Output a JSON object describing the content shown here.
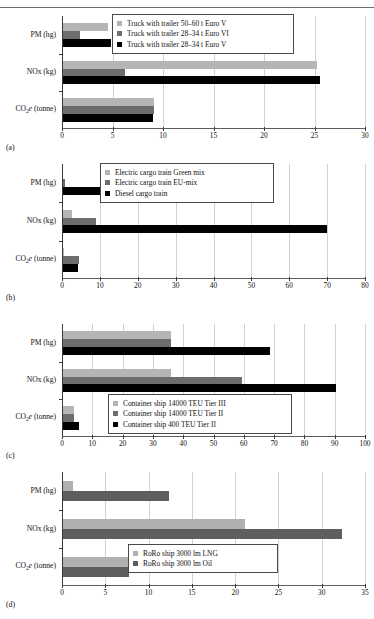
{
  "figure": {
    "ghost_header": "",
    "categories": [
      "PM (hg)",
      "NOx (kg)",
      "CO2e (tonne)"
    ],
    "colors": {
      "light": "#b5b5b5",
      "medium": "#6d6d6d",
      "dark": "#000000",
      "roro_light": "#b0b0b0",
      "roro_dark": "#5e5e5e",
      "grid": "#d2d2d2",
      "axis": "#3a3a3a"
    }
  },
  "panels": [
    {
      "tag": "(a)",
      "chart_data": {
        "type": "bar",
        "orientation": "horizontal",
        "title": "",
        "xlabel": "",
        "ylabel": "",
        "xlim": [
          0,
          30
        ],
        "xticks": [
          0,
          5,
          10,
          15,
          20,
          25,
          30
        ],
        "grid": true,
        "legend_position": "top-right-inside",
        "categories": [
          "PM (hg)",
          "NOx (kg)",
          "CO2e (tonne)"
        ],
        "series": [
          {
            "name": "Truck with trailer 50–60 t Euro V",
            "color": "#b5b5b5",
            "values": [
              4.6,
              25.2,
              9.1
            ]
          },
          {
            "name": "Truck with trailer 28–34 t Euro VI",
            "color": "#6d6d6d",
            "values": [
              1.8,
              6.2,
              9.1
            ]
          },
          {
            "name": "Truck with trailer 28–34 t Euro V",
            "color": "#000000",
            "values": [
              4.9,
              25.5,
              9.0
            ]
          }
        ]
      }
    },
    {
      "tag": "(b)",
      "chart_data": {
        "type": "bar",
        "orientation": "horizontal",
        "title": "",
        "xlabel": "",
        "ylabel": "",
        "xlim": [
          0,
          80
        ],
        "xticks": [
          0,
          10,
          20,
          30,
          40,
          50,
          60,
          70,
          80
        ],
        "grid": true,
        "legend_position": "top-center-inside",
        "categories": [
          "PM (hg)",
          "NOx (kg)",
          "CO2e (tonne)"
        ],
        "series": [
          {
            "name": "Electric cargo train Green mix",
            "color": "#b5b5b5",
            "values": [
              0.2,
              2.6,
              0.5
            ]
          },
          {
            "name": "Electric cargo train EU-mix",
            "color": "#6d6d6d",
            "values": [
              0.8,
              9.0,
              4.6
            ]
          },
          {
            "name": "Diesel cargo train",
            "color": "#000000",
            "values": [
              13.2,
              70.0,
              4.1
            ]
          }
        ]
      }
    },
    {
      "tag": "(c)",
      "chart_data": {
        "type": "bar",
        "orientation": "horizontal",
        "title": "",
        "xlabel": "",
        "ylabel": "",
        "xlim": [
          0,
          100
        ],
        "xticks": [
          0,
          10,
          20,
          30,
          40,
          50,
          60,
          70,
          80,
          90,
          100
        ],
        "grid": true,
        "legend_position": "bottom-center-inside",
        "categories": [
          "PM (hg)",
          "NOx (kg)",
          "CO2e (tonne)"
        ],
        "series": [
          {
            "name": "Container ship 14000 TEU Tier III",
            "color": "#b5b5b5",
            "values": [
              36.0,
              36.0,
              4.0
            ]
          },
          {
            "name": "Container ship 14000 TEU Tier II",
            "color": "#6d6d6d",
            "values": [
              36.0,
              59.5,
              4.0
            ]
          },
          {
            "name": "Container ship 400 TEU Tier II",
            "color": "#000000",
            "values": [
              68.5,
              90.5,
              5.5
            ]
          }
        ]
      }
    },
    {
      "tag": "(d)",
      "chart_data": {
        "type": "bar",
        "orientation": "horizontal",
        "title": "",
        "xlabel": "",
        "ylabel": "",
        "xlim": [
          0,
          35
        ],
        "xticks": [
          0,
          5,
          10,
          15,
          20,
          25,
          30,
          35
        ],
        "grid": true,
        "legend_position": "bottom-center-inside",
        "categories": [
          "PM (hg)",
          "NOx (kg)",
          "CO2e (tonne)"
        ],
        "series": [
          {
            "name": "RoRo ship 3000 lm LNG",
            "color": "#b0b0b0",
            "values": [
              1.3,
              21.1,
              7.6
            ]
          },
          {
            "name": "RoRo ship 3000 lm Oil",
            "color": "#5e5e5e",
            "values": [
              12.4,
              32.3,
              7.7
            ]
          }
        ]
      }
    }
  ]
}
